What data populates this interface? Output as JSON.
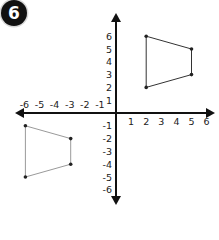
{
  "problem": {
    "number": "6"
  },
  "chart_data": {
    "type": "scatter",
    "title": "",
    "xlabel": "",
    "ylabel": "",
    "xlim": [
      -6,
      6
    ],
    "ylim": [
      -6,
      6
    ],
    "grid": false,
    "x_tick_labels": [
      "-6",
      "-5",
      "-4",
      "-3",
      "-2",
      "-1",
      "1",
      "2",
      "3",
      "4",
      "5",
      "6"
    ],
    "y_tick_labels": [
      "6",
      "5",
      "4",
      "3",
      "2",
      "1",
      "-1",
      "-2",
      "-3",
      "-4",
      "-5",
      "-6"
    ],
    "series": [
      {
        "name": "quadrilateral-quadrant-1",
        "shape": "polygon",
        "points": [
          [
            2,
            6
          ],
          [
            5,
            5
          ],
          [
            5,
            3
          ],
          [
            2,
            2
          ]
        ],
        "color": "#333333"
      },
      {
        "name": "quadrilateral-quadrant-3",
        "shape": "polygon",
        "points": [
          [
            -6,
            -1
          ],
          [
            -3,
            -2
          ],
          [
            -3,
            -4
          ],
          [
            -6,
            -5
          ]
        ],
        "color": "#9a9a9a"
      }
    ]
  },
  "axes": {
    "x_labels": [
      {
        "text": "-6",
        "u": -6
      },
      {
        "text": "-5",
        "u": -5
      },
      {
        "text": "-4",
        "u": -4
      },
      {
        "text": "-3",
        "u": -3
      },
      {
        "text": "-2",
        "u": -2
      },
      {
        "text": "-1",
        "u": -1
      },
      {
        "text": "1",
        "u": 1
      },
      {
        "text": "2",
        "u": 2
      },
      {
        "text": "3",
        "u": 3
      },
      {
        "text": "4",
        "u": 4
      },
      {
        "text": "5",
        "u": 5
      },
      {
        "text": "6",
        "u": 6
      }
    ],
    "y_labels": [
      {
        "text": "6",
        "u": 6
      },
      {
        "text": "5",
        "u": 5
      },
      {
        "text": "4",
        "u": 4
      },
      {
        "text": "3",
        "u": 3
      },
      {
        "text": "2",
        "u": 2
      },
      {
        "text": "1",
        "u": 1
      },
      {
        "text": "-1",
        "u": -1
      },
      {
        "text": "-2",
        "u": -2
      },
      {
        "text": "-3",
        "u": -3
      },
      {
        "text": "-4",
        "u": -4
      },
      {
        "text": "-5",
        "u": -5
      },
      {
        "text": "-6",
        "u": -6
      }
    ]
  }
}
